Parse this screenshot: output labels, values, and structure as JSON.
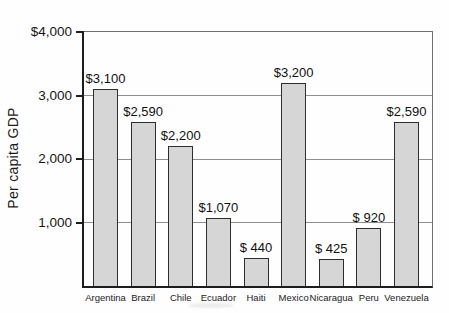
{
  "figure": {
    "kind": "scanned textbook bar chart"
  },
  "chart_data": {
    "type": "bar",
    "title": "",
    "xlabel": "",
    "ylabel": "Per capita GDP",
    "categories": [
      "Argentina",
      "Brazil",
      "Chile",
      "Ecuador",
      "Haiti",
      "Mexico",
      "Nicaragua",
      "Peru",
      "Venezuela"
    ],
    "values": [
      3100,
      2590,
      2200,
      1070,
      440,
      3200,
      425,
      920,
      2590
    ],
    "value_labels": [
      "$3,100",
      "$2,590",
      "$2,200",
      "$1,070",
      "$ 440",
      "$3,200",
      "$ 425",
      "$ 920",
      "$2,590"
    ],
    "ylim": [
      0,
      4000
    ],
    "yticks": [
      {
        "value": 1000,
        "label": "1,000"
      },
      {
        "value": 2000,
        "label": "2,000"
      },
      {
        "value": 3000,
        "label": "3,000"
      },
      {
        "value": 4000,
        "label": "$4,000"
      }
    ],
    "grid": "horizontal",
    "legend": "none",
    "colors": {
      "bar_fill": "#d6d6d6",
      "bar_border": "#2e2e2e",
      "grid": "#8f8f8f",
      "axis": "#1d1d1d",
      "box_border": "#6f6f6f",
      "text": "#141414",
      "background": "#ffffff"
    }
  }
}
